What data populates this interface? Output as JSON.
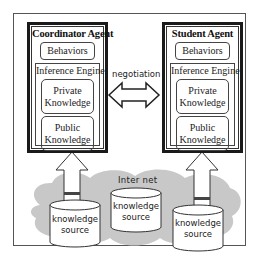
{
  "diagram": {
    "agents": [
      {
        "title": "Coordinator Agent",
        "behaviors": "Behaviors",
        "engine": "Inference Engine",
        "private": [
          "Private",
          "Knowledge"
        ],
        "public": [
          "Public",
          "Knowledge"
        ]
      },
      {
        "title": "Student Agent",
        "behaviors": "Behaviors",
        "engine": "Inference Engine",
        "private": [
          "Private",
          "Knowledge"
        ],
        "public": [
          "Public",
          "Knowledge"
        ]
      }
    ],
    "negotiation_label": "negotiation",
    "internet_label": "Inter net",
    "sources": [
      [
        "knowledge",
        "source"
      ],
      [
        "knowledge",
        "source"
      ],
      [
        "knowledge",
        "source"
      ]
    ],
    "colors": {
      "cloud": "#c8c8c8",
      "border": "#1a1a1a",
      "cylinder_fill": "#ffffff",
      "arrow_fill": "#ffffff"
    }
  }
}
